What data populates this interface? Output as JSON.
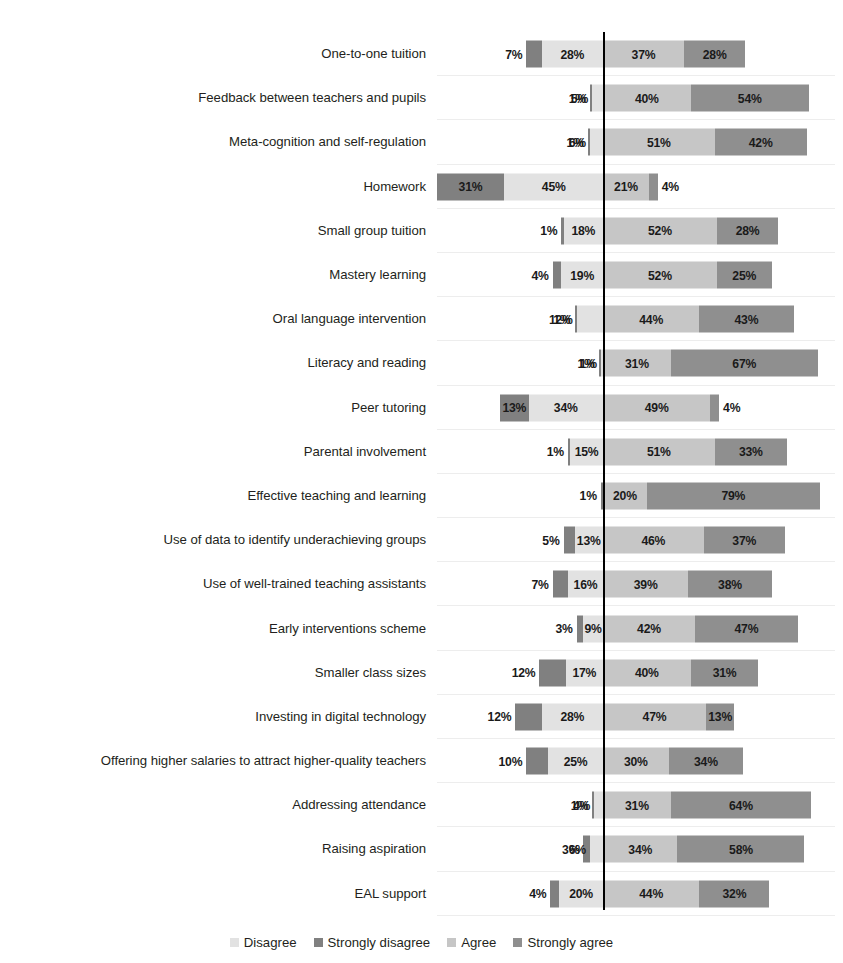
{
  "chart_data": {
    "type": "bar",
    "subtype": "diverging-stacked-bar",
    "title": "",
    "xlabel": "",
    "ylabel": "",
    "grid": true,
    "legend_position": "bottom",
    "value_suffix": "%",
    "zero_line": true,
    "axis_min": -100,
    "axis_max": 100,
    "series": [
      {
        "name": "Strongly disagree",
        "color": "#808080",
        "direction": "left",
        "order": 1
      },
      {
        "name": "Disagree",
        "color": "#e2e2e2",
        "direction": "left",
        "order": 2
      },
      {
        "name": "Agree",
        "color": "#c6c6c6",
        "direction": "right",
        "order": 3
      },
      {
        "name": "Strongly agree",
        "color": "#8f8f8f",
        "direction": "right",
        "order": 4
      }
    ],
    "categories": [
      "One-to-one tuition",
      "Feedback between teachers and pupils",
      "Meta-cognition and self-regulation",
      "Homework",
      "Small group tuition",
      "Mastery learning",
      "Oral language intervention",
      "Literacy and reading",
      "Peer tutoring",
      "Parental involvement",
      "Effective teaching and learning",
      "Use of data to identify underachieving groups",
      "Use of  well-trained  teaching assistants",
      "Early interventions scheme",
      "Smaller class sizes",
      "Investing in digital technology",
      "Offering higher salaries to attract higher-quality teachers",
      "Addressing attendance",
      "Raising aspiration",
      "EAL support"
    ],
    "rows": [
      {
        "category": "One-to-one tuition",
        "strongly_disagree": 7,
        "disagree": 28,
        "agree": 37,
        "strongly_agree": 28
      },
      {
        "category": "Feedback between teachers and pupils",
        "strongly_disagree": 1,
        "disagree": 5,
        "agree": 40,
        "strongly_agree": 54
      },
      {
        "category": "Meta-cognition and self-regulation",
        "strongly_disagree": 1,
        "disagree": 6,
        "agree": 51,
        "strongly_agree": 42
      },
      {
        "category": "Homework",
        "strongly_disagree": 31,
        "disagree": 45,
        "agree": 21,
        "strongly_agree": 4
      },
      {
        "category": "Small group tuition",
        "strongly_disagree": 1,
        "disagree": 18,
        "agree": 52,
        "strongly_agree": 28
      },
      {
        "category": "Mastery learning",
        "strongly_disagree": 4,
        "disagree": 19,
        "agree": 52,
        "strongly_agree": 25
      },
      {
        "category": "Oral language intervention",
        "strongly_disagree": 1,
        "disagree": 12,
        "agree": 44,
        "strongly_agree": 43
      },
      {
        "category": "Literacy and reading",
        "strongly_disagree": 1,
        "disagree": 1,
        "agree": 31,
        "strongly_agree": 67
      },
      {
        "category": "Peer tutoring",
        "strongly_disagree": 13,
        "disagree": 34,
        "agree": 49,
        "strongly_agree": 4
      },
      {
        "category": "Parental involvement",
        "strongly_disagree": 1,
        "disagree": 15,
        "agree": 51,
        "strongly_agree": 33
      },
      {
        "category": "Effective teaching and learning",
        "strongly_disagree": 1,
        "disagree": 0,
        "agree": 20,
        "strongly_agree": 79
      },
      {
        "category": "Use of data to identify underachieving groups",
        "strongly_disagree": 5,
        "disagree": 13,
        "agree": 46,
        "strongly_agree": 37
      },
      {
        "category": "Use of  well-trained  teaching assistants",
        "strongly_disagree": 7,
        "disagree": 16,
        "agree": 39,
        "strongly_agree": 38
      },
      {
        "category": "Early interventions scheme",
        "strongly_disagree": 3,
        "disagree": 9,
        "agree": 42,
        "strongly_agree": 47
      },
      {
        "category": "Smaller class sizes",
        "strongly_disagree": 12,
        "disagree": 17,
        "agree": 40,
        "strongly_agree": 31
      },
      {
        "category": "Investing in digital technology",
        "strongly_disagree": 12,
        "disagree": 28,
        "agree": 47,
        "strongly_agree": 13
      },
      {
        "category": "Offering higher salaries to attract higher-quality teachers",
        "strongly_disagree": 10,
        "disagree": 25,
        "agree": 30,
        "strongly_agree": 34
      },
      {
        "category": "Addressing attendance",
        "strongly_disagree": 1,
        "disagree": 4,
        "agree": 31,
        "strongly_agree": 64
      },
      {
        "category": "Raising aspiration",
        "strongly_disagree": 3,
        "disagree": 6,
        "agree": 34,
        "strongly_agree": 58
      },
      {
        "category": "EAL support",
        "strongly_disagree": 4,
        "disagree": 20,
        "agree": 44,
        "strongly_agree": 32
      }
    ],
    "labels": [
      [
        "7%",
        "28%",
        "37%",
        "28%"
      ],
      [
        "1%",
        "5%",
        "40%",
        "54%"
      ],
      [
        "1%",
        "6%",
        "51%",
        "42%"
      ],
      [
        "31%",
        "45%",
        "21%",
        "4%"
      ],
      [
        "1%",
        "18%",
        "52%",
        "28%"
      ],
      [
        "4%",
        "19%",
        "52%",
        "25%"
      ],
      [
        "1%",
        "12%",
        "44%",
        "43%"
      ],
      [
        "1%",
        "1%",
        "31%",
        "67%"
      ],
      [
        "13%",
        "34%",
        "49%",
        "4%"
      ],
      [
        "1%",
        "15%",
        "51%",
        "33%"
      ],
      [
        "1%",
        "",
        "20%",
        "79%"
      ],
      [
        "5%",
        "13%",
        "46%",
        "37%"
      ],
      [
        "7%",
        "16%",
        "39%",
        "38%"
      ],
      [
        "3%",
        "9%",
        "42%",
        "47%"
      ],
      [
        "12%",
        "17%",
        "40%",
        "31%"
      ],
      [
        "12%",
        "28%",
        "47%",
        "13%"
      ],
      [
        "10%",
        "25%",
        "30%",
        "34%"
      ],
      [
        "1%",
        "4%",
        "31%",
        "64%"
      ],
      [
        "3%",
        "6%",
        "34%",
        "58%"
      ],
      [
        "4%",
        "20%",
        "44%",
        "32%"
      ]
    ]
  },
  "legend": {
    "items": [
      {
        "label": "Disagree",
        "color": "#e2e2e2"
      },
      {
        "label": "Strongly disagree",
        "color": "#808080"
      },
      {
        "label": "Agree",
        "color": "#c6c6c6"
      },
      {
        "label": "Strongly agree",
        "color": "#8f8f8f"
      }
    ]
  }
}
